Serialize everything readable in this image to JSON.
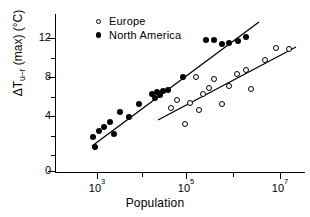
{
  "figure": {
    "background": "#ffffff",
    "ink_color": "#000000"
  },
  "axes": {
    "x": {
      "title": "Population",
      "scale": "log",
      "major_ticks": [
        {
          "label_mantissa": "10",
          "label_exponent": "3",
          "value": 1000,
          "px": 97
        },
        {
          "label_mantissa": "10",
          "label_exponent": "5",
          "value": 100000,
          "px": 186
        },
        {
          "label_mantissa": "10",
          "label_exponent": "7",
          "value": 10000000,
          "px": 280
        }
      ],
      "minor_ticks_px": [
        142,
        233
      ],
      "range_px": [
        55,
        305
      ]
    },
    "y": {
      "title_parts": {
        "delta_t": "ΔT",
        "subscript": "u–r",
        "qualifier": "(max)",
        "units": "(°C)"
      },
      "title_plain": "ΔT u–r (max) (°C)",
      "scale": "linear",
      "major_ticks": [
        {
          "label": "12",
          "value": 12,
          "px": 38
        },
        {
          "label": "8",
          "value": 8,
          "px": 77
        },
        {
          "label": "4",
          "value": 4,
          "px": 116
        },
        {
          "label": "0",
          "value": 0,
          "px": 171
        }
      ],
      "minor_ticks_px": [
        58,
        97,
        136,
        155
      ],
      "range_px": [
        14,
        172
      ]
    }
  },
  "legend": {
    "position": "top-left-inside",
    "entries": [
      {
        "marker": "open-circle",
        "label": "Europe"
      },
      {
        "marker": "filled-circle",
        "label": "North America"
      }
    ]
  },
  "chart_data": {
    "type": "scatter",
    "title": "",
    "xlabel": "Population",
    "ylabel": "ΔT u–r (max) (°C)",
    "xscale": "log",
    "yscale": "linear",
    "xlim": [
      200,
      20000000
    ],
    "ylim": [
      0,
      13.5
    ],
    "grid": false,
    "legend_position": "upper left",
    "series": [
      {
        "name": "North America",
        "marker": "filled-circle",
        "points_px": [
          [
            93,
            137
          ],
          [
            95,
            147
          ],
          [
            99,
            131
          ],
          [
            104,
            127
          ],
          [
            110,
            122
          ],
          [
            114,
            134
          ],
          [
            120,
            112
          ],
          [
            129,
            117
          ],
          [
            139,
            104
          ],
          [
            152,
            94
          ],
          [
            155,
            98
          ],
          [
            157,
            92
          ],
          [
            160,
            95
          ],
          [
            163,
            91
          ],
          [
            168,
            90
          ],
          [
            183,
            77
          ],
          [
            206,
            40
          ],
          [
            214,
            40
          ],
          [
            222,
            44
          ],
          [
            229,
            43
          ],
          [
            238,
            41
          ],
          [
            246,
            37
          ]
        ],
        "points_data": [
          {
            "population": 850,
            "dT": 2.7
          },
          {
            "population": 1000,
            "dT": 1.9
          },
          {
            "population": 1300,
            "dT": 3.2
          },
          {
            "population": 1700,
            "dT": 3.5
          },
          {
            "population": 2300,
            "dT": 4.4
          },
          {
            "population": 2900,
            "dT": 3.6
          },
          {
            "population": 4000,
            "dT": 5.4
          },
          {
            "population": 6500,
            "dT": 5.2
          },
          {
            "population": 12000,
            "dT": 6.3
          },
          {
            "population": 34000,
            "dT": 7.0
          },
          {
            "population": 40000,
            "dT": 6.8
          },
          {
            "population": 45000,
            "dT": 7.2
          },
          {
            "population": 52000,
            "dT": 7.0
          },
          {
            "population": 60000,
            "dT": 7.3
          },
          {
            "population": 75000,
            "dT": 7.4
          },
          {
            "population": 200000,
            "dT": 8.0
          },
          {
            "population": 1000000,
            "dT": 11.9
          },
          {
            "population": 1500000,
            "dT": 11.9
          },
          {
            "population": 2200000,
            "dT": 11.6
          },
          {
            "population": 2800000,
            "dT": 11.7
          },
          {
            "population": 4000000,
            "dT": 11.9
          },
          {
            "population": 5200000,
            "dT": 12.3
          }
        ],
        "fit_line_px": {
          "x1": 92,
          "y1": 146,
          "x2": 259,
          "y2": 22
        },
        "fit_line_data": {
          "x1": 1000,
          "y1": 2.7,
          "x2": 2400000,
          "y2": 12.9
        }
      },
      {
        "name": "Europe",
        "marker": "open-circle",
        "points_px": [
          [
            171,
            108
          ],
          [
            177,
            100
          ],
          [
            185,
            124
          ],
          [
            190,
            103
          ],
          [
            196,
            77
          ],
          [
            199,
            110
          ],
          [
            203,
            94
          ],
          [
            209,
            88
          ],
          [
            214,
            79
          ],
          [
            222,
            104
          ],
          [
            229,
            86
          ],
          [
            237,
            74
          ],
          [
            246,
            70
          ],
          [
            251,
            89
          ],
          [
            265,
            60
          ],
          [
            276,
            48
          ],
          [
            289,
            49
          ]
        ],
        "points_data": [
          {
            "population": 38000,
            "dT": 6.0
          },
          {
            "population": 55000,
            "dT": 6.5
          },
          {
            "population": 95000,
            "dT": 4.6
          },
          {
            "population": 130000,
            "dT": 6.4
          },
          {
            "population": 190000,
            "dT": 9.7
          },
          {
            "population": 230000,
            "dT": 5.9
          },
          {
            "population": 300000,
            "dT": 7.1
          },
          {
            "population": 420000,
            "dT": 7.5
          },
          {
            "population": 560000,
            "dT": 8.0
          },
          {
            "population": 1100000,
            "dT": 6.2
          },
          {
            "population": 1700000,
            "dT": 7.6
          },
          {
            "population": 2600000,
            "dT": 8.2
          },
          {
            "population": 4300000,
            "dT": 8.6
          },
          {
            "population": 5400000,
            "dT": 7.2
          },
          {
            "population": 6000000,
            "dT": 9.3
          },
          {
            "population": 8500000,
            "dT": 10.4
          },
          {
            "population": 11000000,
            "dT": 10.3
          }
        ],
        "fit_line_px": {
          "x1": 158,
          "y1": 120,
          "x2": 296,
          "y2": 47
        },
        "fit_line_data": {
          "x1": 22000,
          "y1": 5.3,
          "x2": 12000000,
          "y2": 10.6
        }
      }
    ]
  }
}
